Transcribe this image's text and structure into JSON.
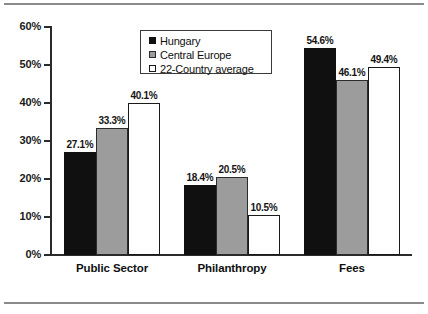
{
  "chart_data": {
    "type": "bar",
    "title": "",
    "subtitle": "",
    "xlabel": "",
    "ylabel": "",
    "categories": [
      "Public Sector",
      "Philanthropy",
      "Fees"
    ],
    "series": [
      {
        "name": "Hungary",
        "color": "#101010",
        "values": [
          27.1,
          18.4,
          54.6
        ]
      },
      {
        "name": "Central Europe",
        "color": "#9c9c9c",
        "values": [
          33.3,
          20.5,
          46.1
        ]
      },
      {
        "name": "22-Country average",
        "color": "#ffffff",
        "values": [
          40.1,
          10.5,
          49.4
        ]
      }
    ],
    "data_labels": [
      [
        "27.1%",
        "18.4%",
        "54.6%"
      ],
      [
        "33.3%",
        "20.5%",
        "46.1%"
      ],
      [
        "40.1%",
        "10.5%",
        "49.4%"
      ]
    ],
    "ylim": [
      0,
      60
    ],
    "ytick_step": 10,
    "ytick_labels": [
      "0%",
      "10%",
      "20%",
      "30%",
      "40%",
      "50%",
      "60%"
    ],
    "ytick_values": [
      0,
      10,
      20,
      30,
      40,
      50,
      60
    ],
    "grid": false,
    "legend_position": "top-center"
  },
  "legend": {
    "entries": [
      {
        "label": "Hungary"
      },
      {
        "label": "Central Europe"
      },
      {
        "label": "22-Country average"
      }
    ]
  }
}
